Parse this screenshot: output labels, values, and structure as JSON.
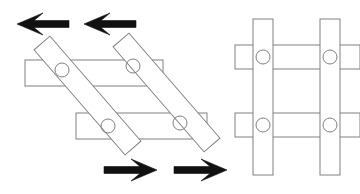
{
  "figure": {
    "width": 360,
    "height": 194,
    "background_color": "#ffffff",
    "bar_stroke_color": "#808080",
    "bar_fill_color": "#ffffff",
    "pivot_stroke_color": "#808080",
    "arrow_fill_color": "#111111",
    "bar_stroke_width": 1,
    "pivot_radius": 7
  },
  "panels": [
    {
      "id": "sheared-lattice",
      "name": "left-panel-sheared-state",
      "label": "",
      "description": "Pin-jointed lattice in sheared configuration: diagonal bars crossing horizontal bars",
      "bar_width": 18,
      "horizontal_bars": [
        {
          "name": "upper-horizontal-bar",
          "x": 25,
          "y": 60,
          "length": 138,
          "thickness": 26
        },
        {
          "name": "lower-horizontal-bar",
          "x": 76,
          "y": 113,
          "length": 131,
          "thickness": 26
        }
      ],
      "diagonal_bars": [
        {
          "name": "left-diagonal-bar",
          "x1": 42,
          "y1": 43,
          "x2": 133,
          "y2": 148,
          "thickness": 21
        },
        {
          "name": "right-diagonal-bar",
          "x1": 121,
          "y1": 40,
          "x2": 212,
          "y2": 145,
          "thickness": 21
        }
      ],
      "pivots": [
        {
          "name": "pivot-upper-left",
          "cx": 62,
          "cy": 70
        },
        {
          "name": "pivot-upper-right",
          "cx": 133,
          "cy": 66
        },
        {
          "name": "pivot-lower-left",
          "cx": 108,
          "cy": 126
        },
        {
          "name": "pivot-lower-right",
          "cx": 180,
          "cy": 123
        }
      ]
    },
    {
      "id": "orthogonal-lattice",
      "name": "right-panel-orthogonal-state",
      "label": "",
      "description": "Pin-jointed lattice in orthogonal configuration: vertical bars crossing horizontal bars",
      "bar_width": 20,
      "vertical_bars": [
        {
          "name": "left-vertical-bar",
          "x": 253,
          "y": 19,
          "length": 156,
          "thickness": 20
        },
        {
          "name": "right-vertical-bar",
          "x": 320,
          "y": 19,
          "length": 156,
          "thickness": 20
        }
      ],
      "horizontal_bars": [
        {
          "name": "upper-horizontal-bar",
          "x": 235,
          "y": 45,
          "length": 125,
          "thickness": 24
        },
        {
          "name": "lower-horizontal-bar",
          "x": 235,
          "y": 113,
          "length": 125,
          "thickness": 24
        }
      ],
      "pivots": [
        {
          "name": "pivot-upper-left",
          "cx": 263,
          "cy": 57
        },
        {
          "name": "pivot-upper-right",
          "cx": 330,
          "cy": 57
        },
        {
          "name": "pivot-lower-left",
          "cx": 263,
          "cy": 125
        },
        {
          "name": "pivot-lower-right",
          "cx": 330,
          "cy": 125
        }
      ]
    }
  ],
  "arrows": [
    {
      "name": "shear-arrow-top-left",
      "direction": "left",
      "tip_x": 17,
      "tail_x": 69,
      "y": 24,
      "shaft_thickness": 7,
      "head_length": 26,
      "head_half_width": 11,
      "barb_inset": 9
    },
    {
      "name": "shear-arrow-top-right",
      "direction": "left",
      "tip_x": 84,
      "tail_x": 136,
      "y": 24,
      "shaft_thickness": 7,
      "head_length": 26,
      "head_half_width": 11,
      "barb_inset": 9
    },
    {
      "name": "shear-arrow-bottom-left",
      "direction": "right",
      "tip_x": 157,
      "tail_x": 104,
      "y": 170,
      "shaft_thickness": 7,
      "head_length": 26,
      "head_half_width": 11,
      "barb_inset": 9
    },
    {
      "name": "shear-arrow-bottom-right",
      "direction": "right",
      "tip_x": 227,
      "tail_x": 174,
      "y": 170,
      "shaft_thickness": 7,
      "head_length": 26,
      "head_half_width": 11,
      "barb_inset": 9
    }
  ]
}
